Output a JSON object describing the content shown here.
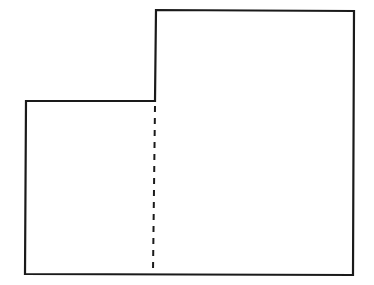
{
  "diagram": {
    "type": "composite-rectangle-figure",
    "stroke_color": "#1a1a1a",
    "background": "#ffffff",
    "outline": {
      "points": [
        [
          26,
          101
        ],
        [
          155,
          101
        ],
        [
          156,
          10
        ],
        [
          354,
          11
        ],
        [
          353,
          275
        ],
        [
          25,
          274
        ]
      ],
      "stroke_width": 2.2
    },
    "divider": {
      "style": "dashed",
      "x1": 155,
      "y1": 106,
      "x2": 153,
      "y2": 272,
      "dash": "6 6",
      "stroke_width": 2
    },
    "regions": [
      {
        "name": "left-rectangle",
        "x": 26,
        "y": 101,
        "width": 129,
        "height": 173
      },
      {
        "name": "right-rectangle",
        "x": 155,
        "y": 10,
        "width": 199,
        "height": 264
      }
    ]
  }
}
